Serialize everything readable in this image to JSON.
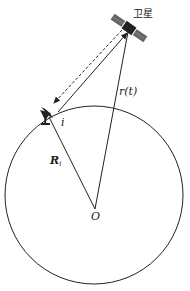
{
  "diagram": {
    "title": "",
    "labels": {
      "satellite": "卫星",
      "range_vector": "r(t)",
      "station": "i",
      "station_radius_main": "R",
      "station_radius_sub": "i",
      "origin": "O"
    },
    "elements": {
      "earth_circle": {
        "cx": 94,
        "cy": 195,
        "r": 89
      },
      "origin_point": {
        "x": 95,
        "y": 209
      },
      "satellite_pos": {
        "x": 129,
        "y": 28
      },
      "station_pos": {
        "x": 47,
        "y": 114
      }
    },
    "colors": {
      "stroke": "#222222",
      "satellite": "#555555"
    }
  }
}
